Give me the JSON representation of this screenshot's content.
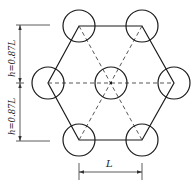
{
  "diagram": {
    "type": "hexagonal-pile-arrangement",
    "dimensions": {
      "upper_height_label": "h=0.87L",
      "lower_height_label": "h=0.87L",
      "spacing_label": "L"
    },
    "nodes": [
      {
        "id": "top-left",
        "x": 79,
        "y": 26
      },
      {
        "id": "top-right",
        "x": 142,
        "y": 26
      },
      {
        "id": "left",
        "x": 48,
        "y": 83
      },
      {
        "id": "center",
        "x": 111,
        "y": 83
      },
      {
        "id": "right",
        "x": 174,
        "y": 83
      },
      {
        "id": "bottom-left",
        "x": 79,
        "y": 140
      },
      {
        "id": "bottom-right",
        "x": 142,
        "y": 140
      }
    ],
    "circle_radius": 16,
    "colors": {
      "line": "#1a1a1a",
      "dashed": "#444444",
      "background": "#ffffff"
    }
  }
}
